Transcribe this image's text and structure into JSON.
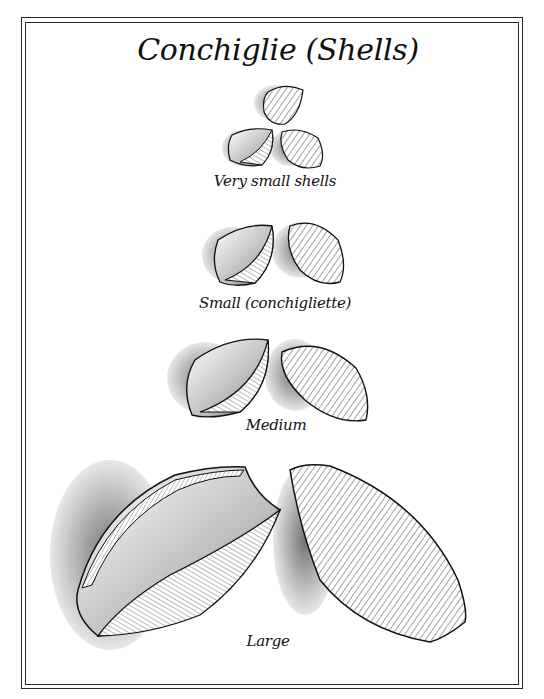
{
  "page": {
    "title": "Conchiglie (Shells)",
    "colors": {
      "ink": "#111111",
      "paper": "#ffffff",
      "frame": "#2a2a2a"
    }
  },
  "sections": [
    {
      "label": "Very small shells",
      "shell_count": 3
    },
    {
      "label": "Small (conchigliette)",
      "shell_count": 2
    },
    {
      "label": "Medium",
      "shell_count": 2
    },
    {
      "label": "Large",
      "shell_count": 2
    }
  ]
}
